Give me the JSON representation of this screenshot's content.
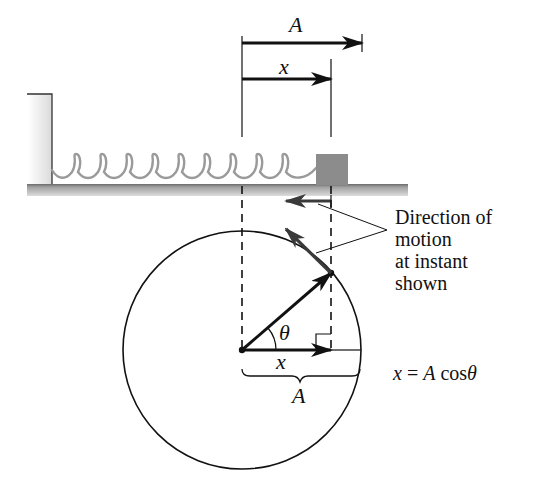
{
  "diagram": {
    "title_labels": {
      "amplitude_top": "A",
      "displacement_top": "x",
      "theta": "θ",
      "displacement_circle": "x",
      "amplitude_brace": "A"
    },
    "annotation": {
      "lines": [
        "Direction of",
        "motion",
        "at instant",
        "shown"
      ]
    },
    "equation": {
      "lhs": "x",
      "eq": " = ",
      "rhs_var": "A",
      "rhs_func": " cos",
      "rhs_angle": "θ"
    },
    "colors": {
      "ink": "#111111",
      "motion_arrow": "#3a3a3a",
      "spring": "#9a9a9a",
      "block": "#8c8c8c",
      "floor": "#a8a8a8",
      "wall": "#e6e6e6"
    }
  }
}
